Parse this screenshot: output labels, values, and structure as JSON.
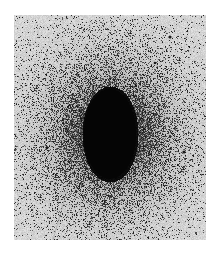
{
  "image": {
    "subject": "elliptical galaxy (photographic negative)",
    "frame": {
      "x": 14,
      "y": 15,
      "width": 192,
      "height": 225
    },
    "colors": {
      "page_bg": "#ffffff",
      "sky": "#d6d6d6",
      "core": "#000000"
    },
    "galaxy": {
      "cx": 96,
      "cy": 119,
      "core_rx": 28,
      "core_ry": 48,
      "halo_rx": 105,
      "halo_ry": 120
    },
    "stars": [
      {
        "x": 156,
        "y": 22,
        "r": 1.6
      },
      {
        "x": 141,
        "y": 48,
        "r": 1.3
      },
      {
        "x": 170,
        "y": 137,
        "r": 1.6
      },
      {
        "x": 33,
        "y": 133,
        "r": 1.3
      },
      {
        "x": 18,
        "y": 195,
        "r": 1.0
      },
      {
        "x": 78,
        "y": 203,
        "r": 1.0
      },
      {
        "x": 1,
        "y": 135,
        "r": 1.0
      },
      {
        "x": 182,
        "y": 218,
        "r": 1.0
      },
      {
        "x": 16,
        "y": 30,
        "r": 0.8
      }
    ],
    "streak": {
      "x1": 56,
      "y1": 165,
      "x2": 39,
      "y2": 225
    }
  }
}
